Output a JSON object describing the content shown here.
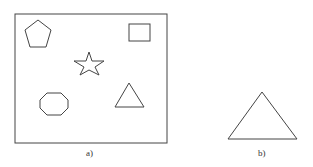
{
  "figure": {
    "panels": [
      {
        "label": "a)",
        "shapes": [
          "pentagon",
          "square",
          "star",
          "octagon",
          "triangle"
        ]
      },
      {
        "label": "b)",
        "shapes": [
          "triangle"
        ]
      }
    ]
  }
}
